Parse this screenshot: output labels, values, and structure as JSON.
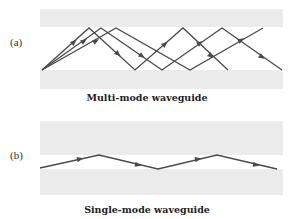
{
  "colors": {
    "cladding": "#ebebeb",
    "core": "#ffffff",
    "ray": "#4a4a4a"
  },
  "panel_a": {
    "label": "(a)",
    "caption": "Multi-mode waveguide",
    "cladding_top": {
      "x": 40,
      "y": 9,
      "w": 243,
      "h": 18
    },
    "cladding_bottom": {
      "x": 40,
      "y": 70,
      "w": 243,
      "h": 19
    },
    "rays": [
      {
        "name": "ray-steep",
        "points": [
          [
            42,
            70
          ],
          [
            89,
            28
          ],
          [
            135,
            70
          ],
          [
            183,
            28
          ],
          [
            228,
            70
          ]
        ]
      },
      {
        "name": "ray-medium",
        "points": [
          [
            42,
            70
          ],
          [
            101,
            28
          ],
          [
            162,
            70
          ],
          [
            222,
            28
          ],
          [
            282,
            70
          ]
        ]
      },
      {
        "name": "ray-shallow",
        "points": [
          [
            42,
            70
          ],
          [
            116,
            28
          ],
          [
            190,
            70
          ],
          [
            263,
            28
          ]
        ]
      }
    ],
    "arrows": [
      {
        "x": 74,
        "y": 42,
        "angle": -42
      },
      {
        "x": 84,
        "y": 41,
        "angle": -35
      },
      {
        "x": 96,
        "y": 41,
        "angle": -30
      },
      {
        "x": 118,
        "y": 54,
        "angle": 42
      },
      {
        "x": 142,
        "y": 56,
        "angle": 35
      },
      {
        "x": 165,
        "y": 44,
        "angle": -42
      },
      {
        "x": 200,
        "y": 43,
        "angle": -35
      },
      {
        "x": 211,
        "y": 56,
        "angle": 42
      },
      {
        "x": 241,
        "y": 40,
        "angle": -30
      },
      {
        "x": 262,
        "y": 57,
        "angle": 35
      }
    ]
  },
  "panel_b": {
    "label": "(b)",
    "caption": "Single-mode waveguide",
    "cladding_top": {
      "x": 40,
      "y": 121,
      "w": 243,
      "h": 34
    },
    "cladding_bottom": {
      "x": 40,
      "y": 169,
      "w": 243,
      "h": 26
    },
    "rays": [
      {
        "name": "ray-single",
        "points": [
          [
            40,
            168
          ],
          [
            99,
            155
          ],
          [
            158,
            169
          ],
          [
            217,
            155
          ],
          [
            277,
            169
          ]
        ]
      }
    ],
    "arrows": [
      {
        "x": 80,
        "y": 159,
        "angle": -12
      },
      {
        "x": 138,
        "y": 165,
        "angle": 13
      },
      {
        "x": 198,
        "y": 159,
        "angle": -12
      },
      {
        "x": 256,
        "y": 165,
        "angle": 13
      }
    ]
  }
}
